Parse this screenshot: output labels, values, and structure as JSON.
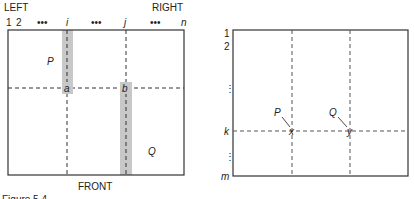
{
  "left_diagram": {
    "labels": {
      "top_left": "LEFT",
      "top_right": "RIGHT",
      "bottom": "FRONT"
    },
    "column_ticks": [
      "1",
      "2",
      "•••",
      "i",
      "•••",
      "j",
      "•••",
      "n"
    ],
    "points": {
      "a": "a",
      "b": "b"
    },
    "regions": {
      "P": "P",
      "Q": "Q"
    },
    "shaded_columns": [
      "i",
      "j"
    ],
    "shade_color": "#c8c8c8"
  },
  "right_diagram": {
    "row_ticks": [
      "1",
      "2",
      "⋮",
      "k",
      "⋮",
      "m"
    ],
    "points": {
      "x": "x",
      "y": "y"
    },
    "pointers": {
      "P": "P",
      "Q": "Q"
    }
  },
  "caption_fragment": "Figure 5.4"
}
